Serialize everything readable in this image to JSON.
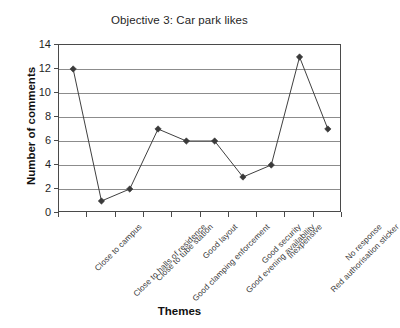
{
  "chart_data": {
    "type": "line",
    "title": "Objective 3: Car park likes",
    "xlabel": "Themes",
    "ylabel": "Number of comments",
    "categories": [
      "Close to campus",
      "Close to halls of residence",
      "Close to tube station",
      "Good clamping enforcement",
      "Good layout",
      "Good evening availability",
      "Good security",
      "Inexpensive",
      "Red authorisation sticker",
      "No response"
    ],
    "values": [
      12,
      1,
      2,
      7,
      6,
      6,
      3,
      4,
      13,
      7
    ],
    "series": [
      {
        "name": "Number of comments",
        "values": [
          12,
          1,
          2,
          7,
          6,
          6,
          3,
          4,
          13,
          7
        ]
      }
    ],
    "ylim": [
      0,
      14
    ],
    "ytick_values": [
      0,
      2,
      4,
      6,
      8,
      10,
      12,
      14
    ],
    "ytick_labels": [
      "0",
      "2",
      "4",
      "6",
      "8",
      "10",
      "12",
      "14"
    ],
    "grid": true,
    "legend": false,
    "marker": "diamond",
    "line_color": "#404040",
    "marker_color": "#3a3a3a",
    "grid_color": "#8c8c8c",
    "axis_color": "#4a4a4a",
    "background_color": "#ffffff"
  }
}
